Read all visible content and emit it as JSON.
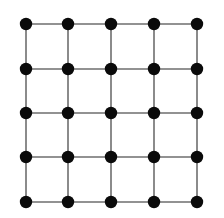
{
  "diagram": {
    "type": "grid-graph",
    "rows": 5,
    "cols": 5,
    "node_count": 25,
    "edge_count": 40,
    "colors": {
      "node": "#0a0a0a",
      "edge": "#6e6e6e",
      "background": "#ffffff"
    }
  }
}
